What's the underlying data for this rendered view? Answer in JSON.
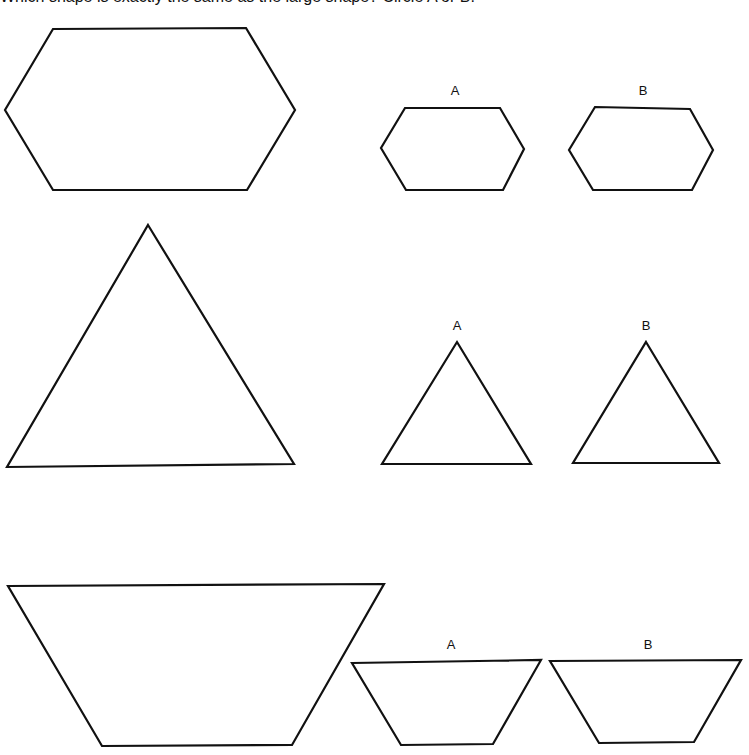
{
  "header": {
    "cropped_text": "Which shape is exactly the same as the large shape? Circle A or B."
  },
  "rows": [
    {
      "name": "hexagon",
      "reference": {
        "points": "53,29 246,28 295,110 247,190 53,190 5,110"
      },
      "options": [
        {
          "label": "A",
          "label_pos": [
            455,
            95
          ],
          "points": "405,108 500,108 524,149 503,190 406,190 381,148"
        },
        {
          "label": "B",
          "label_pos": [
            643,
            95
          ],
          "points": "595,107 690,109 713,150 692,190 593,190 569,150"
        }
      ]
    },
    {
      "name": "triangle",
      "reference": {
        "points": "148,225 294,464 7,467"
      },
      "options": [
        {
          "label": "A",
          "label_pos": [
            457,
            330
          ],
          "points": "457,342 531,464 382,464"
        },
        {
          "label": "B",
          "label_pos": [
            646,
            330
          ],
          "points": "646,342 719,463 573,463"
        }
      ]
    },
    {
      "name": "trapezoid",
      "reference": {
        "points": "8,586 384,584 292,745 102,746"
      },
      "options": [
        {
          "label": "A",
          "label_pos": [
            451,
            649
          ],
          "points": "352,663 541,660 493,744 401,745"
        },
        {
          "label": "B",
          "label_pos": [
            648,
            649
          ],
          "points": "550,661 741,660 694,742 599,743"
        }
      ]
    }
  ]
}
